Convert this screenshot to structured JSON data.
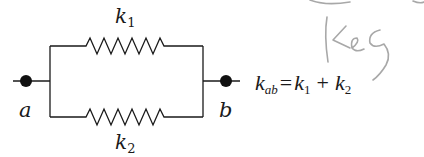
{
  "diagram": {
    "type": "parallel-spring-circuit",
    "nodes": [
      {
        "id": "a",
        "label": "a",
        "cx": 26,
        "cy": 81
      },
      {
        "id": "b",
        "label": "b",
        "cx": 226,
        "cy": 81
      }
    ],
    "elements": [
      {
        "id": "k1",
        "label_base": "k",
        "label_sub": "1",
        "branch": "top"
      },
      {
        "id": "k2",
        "label_base": "k",
        "label_sub": "2",
        "branch": "bottom"
      }
    ],
    "equation": {
      "lhs_base": "k",
      "lhs_sub": "ab",
      "equals": "=",
      "term1_base": "k",
      "term1_sub": "1",
      "plus": "+",
      "term2_base": "k",
      "term2_sub": "2"
    },
    "annotation": {
      "text": "Keq",
      "style": "handwritten pencil",
      "color": "#a8a8a8"
    },
    "colors": {
      "line": "#1a1a1a",
      "node": "#111111",
      "background": "#ffffff"
    }
  }
}
